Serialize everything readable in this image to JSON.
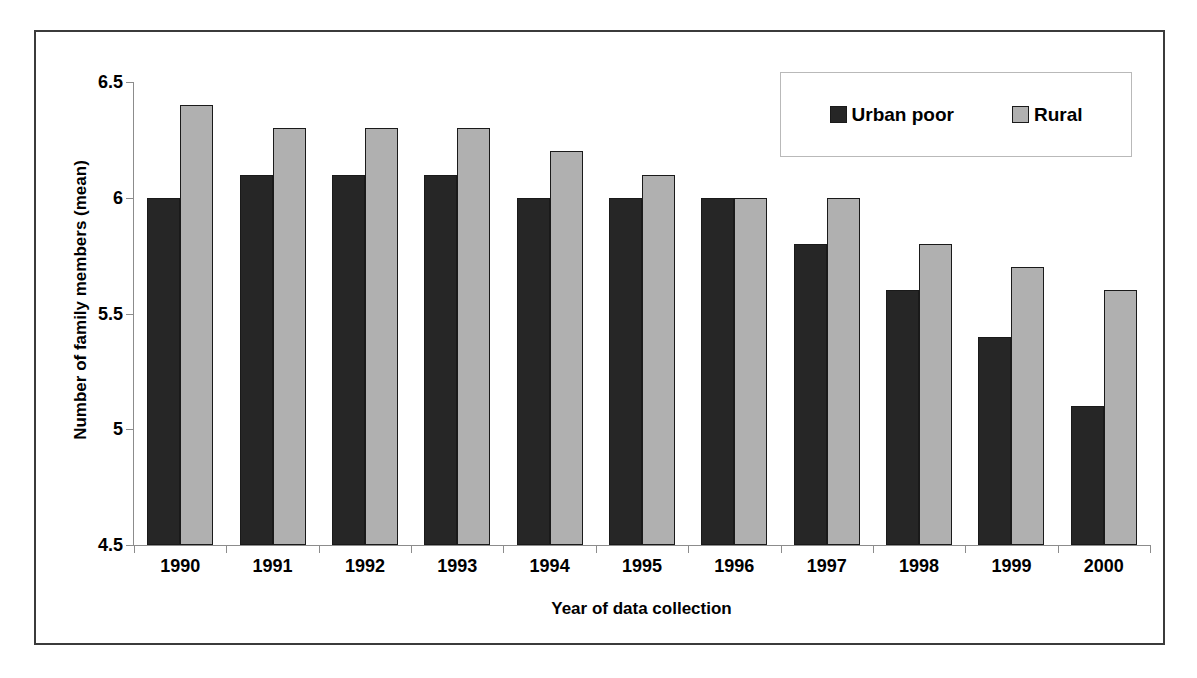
{
  "chart_data": {
    "type": "bar",
    "title": "",
    "subtitle": "",
    "xlabel": "Year of data collection",
    "ylabel": "Number of family members (mean)",
    "categories": [
      "1990",
      "1991",
      "1992",
      "1993",
      "1994",
      "1995",
      "1996",
      "1997",
      "1998",
      "1999",
      "2000"
    ],
    "series": [
      {
        "name": "Urban poor",
        "color": "#262626",
        "values": [
          6.0,
          6.1,
          6.1,
          6.1,
          6.0,
          6.0,
          6.0,
          5.8,
          5.6,
          5.4,
          5.1
        ]
      },
      {
        "name": "Rural",
        "color": "#b0b0b0",
        "values": [
          6.4,
          6.3,
          6.3,
          6.3,
          6.2,
          6.1,
          6.0,
          6.0,
          5.8,
          5.7,
          5.6
        ]
      }
    ],
    "ylim": [
      4.5,
      6.5
    ],
    "ytick_values": [
      4.5,
      5.0,
      5.5,
      6.0,
      6.5
    ],
    "ytick_labels": [
      "4.5",
      "5",
      "5.5",
      "6",
      "6.5"
    ],
    "grid": false,
    "legend_position": "upper-right",
    "bar_edge_color": "#1a1a1a",
    "axis_color": "#8c8c8c",
    "frame_color": "#3b3b3b"
  }
}
